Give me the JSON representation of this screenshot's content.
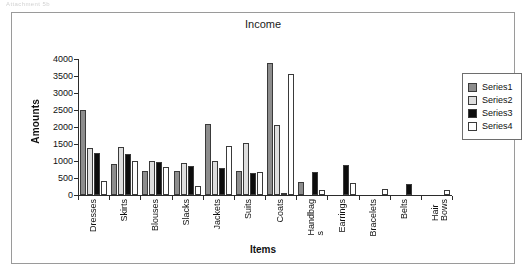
{
  "document_header_text": "Attachment 5b",
  "chart_data": {
    "type": "bar",
    "title": "Income",
    "xlabel": "Items",
    "ylabel": "Amounts",
    "ylim": [
      0,
      4000
    ],
    "ytick_step": 500,
    "yticks": [
      0,
      500,
      1000,
      1500,
      2000,
      2500,
      3000,
      3500,
      4000
    ],
    "ytick_labels": [
      "0",
      "500",
      "1000",
      "1500",
      "2000",
      "2500",
      "3000",
      "3500",
      "4000"
    ],
    "grid": false,
    "legend_position": "right",
    "categories": [
      "Dresses",
      "Skirts",
      "Blouses",
      "Slacks",
      "Jackets",
      "Suits",
      "Coats",
      "Handbags",
      "Earrings",
      "Bracelets",
      "Belts",
      "Hair Bows"
    ],
    "category_label_lines": [
      [
        "Dresses"
      ],
      [
        "Skirts"
      ],
      [
        "Blouses"
      ],
      [
        "Slacks"
      ],
      [
        "Jackets"
      ],
      [
        "Suits"
      ],
      [
        "Coats"
      ],
      [
        "Handbag",
        "s"
      ],
      [
        "Earrings"
      ],
      [
        "Bracelets"
      ],
      [
        "Belts"
      ],
      [
        "Hair",
        "Bows"
      ]
    ],
    "series": [
      {
        "name": "Series1",
        "color": "#8d8d8d",
        "values": [
          2500,
          920,
          710,
          710,
          2080,
          720,
          3880,
          370,
          0,
          0,
          0,
          0
        ]
      },
      {
        "name": "Series2",
        "color": "#dedede",
        "values": [
          1370,
          1410,
          1010,
          930,
          1010,
          1540,
          2070,
          0,
          0,
          0,
          0,
          0
        ]
      },
      {
        "name": "Series3",
        "color": "#0d0d0d",
        "values": [
          1240,
          1200,
          970,
          860,
          800,
          660,
          60,
          670,
          870,
          0,
          330,
          0
        ]
      },
      {
        "name": "Series4",
        "color": "#ffffff",
        "values": [
          400,
          990,
          820,
          270,
          1440,
          690,
          3560,
          160,
          360,
          170,
          0,
          150
        ]
      }
    ]
  },
  "legend": {
    "items": [
      {
        "label": "Series1",
        "swatch": "s1"
      },
      {
        "label": "Series2",
        "swatch": "s2"
      },
      {
        "label": "Series3",
        "swatch": "s3"
      },
      {
        "label": "Series4",
        "swatch": "s4"
      }
    ]
  }
}
